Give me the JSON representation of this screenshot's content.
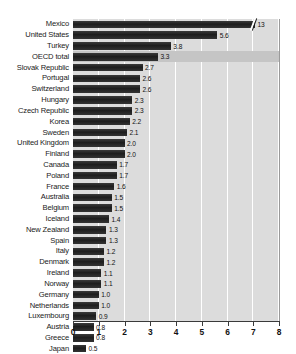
{
  "chart_data": {
    "type": "bar",
    "orientation": "horizontal",
    "title": "",
    "xlabel": "",
    "ylabel": "",
    "xlim": [
      0,
      8
    ],
    "xticks": [
      "0",
      "1",
      "2",
      "3",
      "4",
      "5",
      "6",
      "7",
      "8"
    ],
    "grid": true,
    "legend": "none",
    "note": "Mexico bar is truncated with an axis-break marker; its true value 13 exceeds the 0-8 axis.",
    "categories": [
      "Mexico",
      "United States",
      "Turkey",
      "OECD total",
      "Slovak Republic",
      "Portugal",
      "Switzerland",
      "Hungary",
      "Czech Republic",
      "Korea",
      "Sweden",
      "United Kingdom",
      "Finland",
      "Canada",
      "Poland",
      "France",
      "Australia",
      "Belgium",
      "Iceland",
      "New Zealand",
      "Spain",
      "Italy",
      "Denmark",
      "Ireland",
      "Norway",
      "Germany",
      "Netherlands",
      "Luxembourg",
      "Austria",
      "Greece",
      "Japan"
    ],
    "values": [
      13,
      5.6,
      3.8,
      3.3,
      2.7,
      2.6,
      2.6,
      2.3,
      2.3,
      2.2,
      2.1,
      2.0,
      2.0,
      1.7,
      1.7,
      1.6,
      1.5,
      1.5,
      1.4,
      1.3,
      1.3,
      1.2,
      1.2,
      1.1,
      1.1,
      1.0,
      1.0,
      0.9,
      0.8,
      0.8,
      0.5
    ],
    "value_labels": [
      "13",
      "5.6",
      "3.8",
      "3.3",
      "2.7",
      "2.6",
      "2.6",
      "2.3",
      "2.3",
      "2.2",
      "2.1",
      "2.0",
      "2.0",
      "1.7",
      "1.7",
      "1.6",
      "1.5",
      "1.5",
      "1.4",
      "1.3",
      "1.3",
      "1.2",
      "1.2",
      "1.1",
      "1.1",
      "1.0",
      "1.0",
      "0.9",
      "0.8",
      "0.8",
      "0.5"
    ],
    "highlight_category": "OECD total",
    "bar_color": "#232323",
    "plot_background": "#dcdcdc",
    "highlight_row_color": "#c5c5c5",
    "gridline_color": "#ffffff",
    "axis_color": "#3a3a3a"
  }
}
